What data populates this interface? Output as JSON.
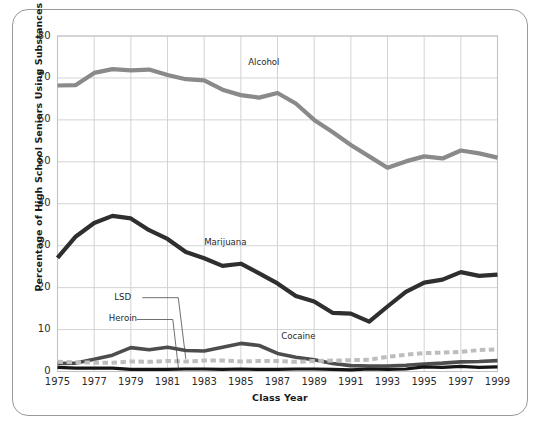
{
  "figure": {
    "frame_color": "#9a9a9a",
    "background": "#ffffff"
  },
  "chart_data": {
    "type": "line",
    "title": "",
    "xlabel": "Class Year",
    "ylabel": "Percentage of High School Seniors Using Substances",
    "xlim": [
      1975,
      1999
    ],
    "ylim": [
      0,
      80
    ],
    "grid": true,
    "legend_position": "inline-annotations",
    "x": [
      1975,
      1976,
      1977,
      1978,
      1979,
      1980,
      1981,
      1982,
      1983,
      1984,
      1985,
      1986,
      1987,
      1988,
      1989,
      1990,
      1991,
      1992,
      1993,
      1994,
      1995,
      1996,
      1997,
      1998,
      1999
    ],
    "xticks": [
      "1975",
      "1977",
      "1979",
      "1981",
      "1983",
      "1985",
      "1987",
      "1989",
      "1991",
      "1993",
      "1995",
      "1997",
      "1999"
    ],
    "xtick_values": [
      1975,
      1977,
      1979,
      1981,
      1983,
      1985,
      1987,
      1989,
      1991,
      1993,
      1995,
      1997,
      1999
    ],
    "yticks": [
      "0",
      "10",
      "20",
      "30",
      "40",
      "50",
      "60",
      "70",
      "80"
    ],
    "ytick_values": [
      0,
      10,
      20,
      30,
      40,
      50,
      60,
      70,
      80
    ],
    "series": [
      {
        "name": "Alcohol",
        "color": "#8a8a8a",
        "style": "solid",
        "width": 4.2,
        "label_x": 1985.4,
        "label_y": 73.6,
        "values": [
          68.2,
          68.3,
          71.2,
          72.1,
          71.8,
          72.0,
          70.7,
          69.7,
          69.4,
          67.2,
          65.9,
          65.3,
          66.4,
          63.9,
          60.0,
          57.1,
          54.0,
          51.3,
          48.6,
          50.1,
          51.3,
          50.8,
          52.7,
          52.0,
          51.0
        ],
        "annotation_point": null
      },
      {
        "name": "Marijuana",
        "color": "#2f2f2f",
        "style": "solid",
        "width": 4.2,
        "label_x": 1983.0,
        "label_y": 30.6,
        "values": [
          27.1,
          32.2,
          35.4,
          37.1,
          36.5,
          33.7,
          31.6,
          28.5,
          27.0,
          25.2,
          25.7,
          23.4,
          21.0,
          18.0,
          16.7,
          14.0,
          13.8,
          11.9,
          15.5,
          19.0,
          21.2,
          21.9,
          23.7,
          22.8,
          23.1
        ],
        "annotation_point": null
      },
      {
        "name": "Cocaine",
        "color": "#4d4d4d",
        "style": "solid",
        "width": 3.6,
        "label_x": 1987.2,
        "label_y": 8.2,
        "values": [
          1.9,
          2.0,
          2.9,
          3.9,
          5.7,
          5.2,
          5.8,
          5.0,
          4.9,
          5.8,
          6.7,
          6.2,
          4.3,
          3.4,
          2.8,
          1.9,
          1.4,
          1.3,
          1.3,
          1.5,
          1.8,
          2.0,
          2.3,
          2.4,
          2.6
        ],
        "annotation_point": null
      },
      {
        "name": "LSD",
        "color": "#bdbdbd",
        "style": "dashed",
        "width": 4.0,
        "label_x": 1978.1,
        "label_y": 17.6,
        "values": [
          2.3,
          2.2,
          2.1,
          2.1,
          2.4,
          2.3,
          2.5,
          2.4,
          2.6,
          2.6,
          2.4,
          2.5,
          2.5,
          2.3,
          2.5,
          2.6,
          2.7,
          2.8,
          3.5,
          4.0,
          4.4,
          4.5,
          4.7,
          5.1,
          5.3
        ],
        "annotation_point": {
          "x": 1982.0,
          "y": 3.0
        }
      },
      {
        "name": "Heroin",
        "color": "#141414",
        "style": "solid",
        "width": 3.2,
        "label_x": 1977.8,
        "label_y": 12.4,
        "values": [
          1.0,
          0.8,
          0.8,
          0.8,
          0.5,
          0.5,
          0.5,
          0.6,
          0.6,
          0.5,
          0.6,
          0.5,
          0.5,
          0.6,
          0.6,
          0.5,
          0.4,
          0.6,
          0.5,
          0.6,
          1.1,
          1.0,
          1.2,
          1.0,
          1.1
        ],
        "annotation_point": {
          "x": 1981.6,
          "y": 0.7
        }
      }
    ]
  }
}
